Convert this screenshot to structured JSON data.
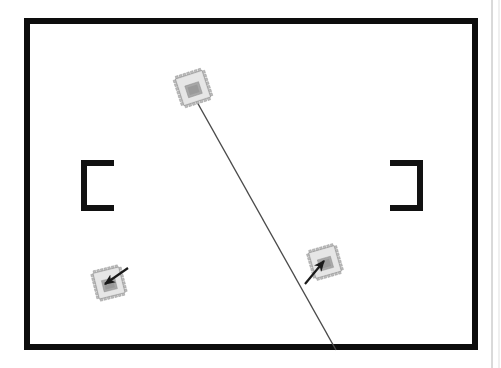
{
  "figure": {
    "title": "Top-down schematic scan: bracketed work area with three IC chip markers",
    "background_color": "#ffffff",
    "width": 501,
    "height": 368
  },
  "colors": {
    "ink_black": "#111111",
    "frame_black": "#0d0d0d",
    "line_gray": "#4a4a4a",
    "chip_body": "#d9d9d9",
    "chip_body_light": "#e6e6e6",
    "chip_pin": "#bdbdbd",
    "chip_core": "#9e9e9e",
    "chip_core_dark": "#8a8a8a",
    "chip_outline": "#8d8d8d",
    "scan_edge_gray": "#9a9a9a",
    "paper_white": "#ffffff"
  },
  "frame": {
    "name": "outer-frame",
    "x": 24,
    "y": 18,
    "width": 454,
    "height": 332,
    "stroke_width": 6,
    "stroke": "#0d0d0d",
    "fill": "#ffffff"
  },
  "brackets": [
    {
      "name": "left-bracket",
      "glyph": "[",
      "x": 81,
      "y": 160,
      "width": 33,
      "height": 51,
      "thickness": 6,
      "orientation": "left"
    },
    {
      "name": "right-bracket",
      "glyph": "]",
      "x": 390,
      "y": 160,
      "width": 33,
      "height": 51,
      "thickness": 6,
      "orientation": "right"
    }
  ],
  "chips": [
    {
      "name": "chip-top",
      "label": "top-chip",
      "cx": 193,
      "cy": 88,
      "size": 36,
      "rotation": -18,
      "pins_per_side": 7
    },
    {
      "name": "chip-mid-right",
      "label": "mid-right-chip",
      "cx": 325,
      "cy": 262,
      "size": 34,
      "rotation": -16,
      "pins_per_side": 7
    },
    {
      "name": "chip-bottom-left",
      "label": "bottom-left-chip",
      "cx": 109,
      "cy": 283,
      "size": 34,
      "rotation": -14,
      "pins_per_side": 7
    }
  ],
  "lines": [
    {
      "name": "long-diagonal-line",
      "x1": 192,
      "y1": 93,
      "x2": 336,
      "y2": 350,
      "stroke": "#4a4a4a",
      "stroke_width": 1.4,
      "has_arrowhead": false
    }
  ],
  "pointers": [
    {
      "name": "pointer-bottom-left-chip",
      "x1": 128,
      "y1": 268,
      "x2": 105,
      "y2": 284,
      "stroke": "#1a1a1a",
      "stroke_width": 2.2,
      "has_arrowhead": true,
      "direction": "down-left"
    },
    {
      "name": "pointer-mid-right-chip",
      "x1": 305,
      "y1": 284,
      "x2": 324,
      "y2": 261,
      "stroke": "#1a1a1a",
      "stroke_width": 2.2,
      "has_arrowhead": true,
      "direction": "up-right"
    }
  ],
  "scan_artifacts": [
    {
      "name": "right-edge-scan-line",
      "x": 492,
      "y1": 0,
      "y2": 368,
      "stroke": "#9a9a9a",
      "stroke_width": 1
    }
  ]
}
